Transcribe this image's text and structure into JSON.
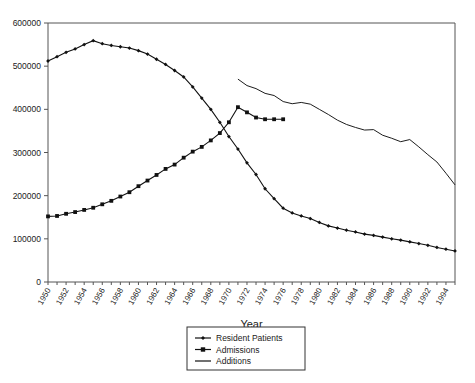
{
  "chart_data": {
    "type": "line",
    "title": "",
    "xlabel": "Year",
    "ylabel": "",
    "ylim": [
      0,
      600000
    ],
    "xlim": [
      1950,
      1995
    ],
    "ytick_values": [
      0,
      100000,
      200000,
      300000,
      400000,
      500000,
      600000
    ],
    "ytick_labels": [
      "0",
      "100000",
      "200000",
      "300000",
      "400000",
      "500000",
      "600000"
    ],
    "xtick_labels": [
      "1950",
      "1952",
      "1954",
      "1956",
      "1958",
      "1960",
      "1962",
      "1964",
      "1966",
      "1968",
      "1970",
      "1972",
      "1974",
      "1976",
      "1978",
      "1980",
      "1982",
      "1984",
      "1986",
      "1988",
      "1990",
      "1992",
      "1994"
    ],
    "xtick_values": [
      1950,
      1952,
      1954,
      1956,
      1958,
      1960,
      1962,
      1964,
      1966,
      1968,
      1970,
      1972,
      1974,
      1976,
      1978,
      1980,
      1982,
      1984,
      1986,
      1988,
      1990,
      1992,
      1994
    ],
    "grid": false,
    "legend_position": "bottom-center",
    "series": [
      {
        "name": "Resident Patients",
        "marker": "diamond",
        "color": "#111111",
        "x": [
          1950,
          1951,
          1952,
          1953,
          1954,
          1955,
          1956,
          1957,
          1958,
          1959,
          1960,
          1961,
          1962,
          1963,
          1964,
          1965,
          1966,
          1967,
          1968,
          1969,
          1970,
          1971,
          1972,
          1973,
          1974,
          1975,
          1976,
          1977,
          1978,
          1979,
          1980,
          1981,
          1982,
          1983,
          1984,
          1985,
          1986,
          1987,
          1988,
          1989,
          1990,
          1991,
          1992,
          1993,
          1994,
          1995
        ],
        "values": [
          512000,
          522000,
          532000,
          540000,
          550000,
          559000,
          552000,
          548000,
          545000,
          542000,
          536000,
          528000,
          516000,
          504000,
          490000,
          475000,
          452000,
          426000,
          400000,
          370000,
          337000,
          308000,
          276000,
          249000,
          216000,
          193000,
          171000,
          160000,
          153000,
          147000,
          138000,
          130000,
          125000,
          120000,
          116000,
          111000,
          108000,
          104000,
          100000,
          97000,
          93000,
          89000,
          85000,
          80000,
          76000,
          72000
        ]
      },
      {
        "name": "Admissions",
        "marker": "square",
        "color": "#111111",
        "x": [
          1950,
          1951,
          1952,
          1953,
          1954,
          1955,
          1956,
          1957,
          1958,
          1959,
          1960,
          1961,
          1962,
          1963,
          1964,
          1965,
          1966,
          1967,
          1968,
          1969,
          1970,
          1971,
          1972,
          1973,
          1974,
          1975,
          1976
        ],
        "values": [
          152000,
          153000,
          158000,
          162000,
          167000,
          172000,
          180000,
          188000,
          198000,
          208000,
          222000,
          235000,
          248000,
          262000,
          272000,
          288000,
          302000,
          313000,
          328000,
          345000,
          370000,
          405000,
          393000,
          381000,
          377000,
          377000,
          377000
        ]
      },
      {
        "name": "Additions",
        "marker": "none",
        "color": "#111111",
        "x": [
          1971,
          1972,
          1973,
          1974,
          1975,
          1976,
          1977,
          1978,
          1979,
          1980,
          1981,
          1982,
          1983,
          1984,
          1985,
          1986,
          1987,
          1988,
          1989,
          1990,
          1991,
          1992,
          1993,
          1994,
          1995
        ],
        "values": [
          470000,
          455000,
          448000,
          437000,
          432000,
          418000,
          413000,
          416000,
          412000,
          400000,
          388000,
          375000,
          365000,
          358000,
          352000,
          353000,
          340000,
          333000,
          325000,
          330000,
          313000,
          295000,
          278000,
          252000,
          225000
        ]
      }
    ]
  },
  "legend": {
    "items": [
      {
        "label": "Resident Patients",
        "marker": "diamond"
      },
      {
        "label": "Admissions",
        "marker": "square"
      },
      {
        "label": "Additions",
        "marker": "line"
      }
    ]
  },
  "axis": {
    "x_title": "Year"
  }
}
